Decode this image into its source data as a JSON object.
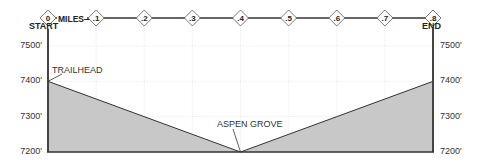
{
  "chart_data": {
    "type": "area",
    "title": "",
    "xlabel": "MILES",
    "ylabel": "",
    "x": [
      0,
      0.4,
      0.8
    ],
    "values": [
      7400,
      7200,
      7400
    ],
    "xlim": [
      0,
      0.8
    ],
    "ylim": [
      7200,
      7500
    ],
    "x_ticks": [
      "0",
      ".1",
      ".2",
      ".3",
      ".4",
      ".5",
      ".6",
      ".7",
      ".8"
    ],
    "y_ticks": [
      "7200'",
      "7300'",
      "7400'",
      "7500'"
    ],
    "grid": true,
    "annotations": [
      {
        "label": "START",
        "x": 0
      },
      {
        "label": "END",
        "x": 0.8
      },
      {
        "label": "TRAILHEAD",
        "x": 0,
        "y": 7400
      },
      {
        "label": "ASPEN GROVE",
        "x": 0.4,
        "y": 7200
      }
    ],
    "colors": {
      "fill": "#c8c8c8",
      "line": "#333333",
      "grid": "#e4e4e4"
    }
  },
  "labels": {
    "miles": "MILES",
    "start": "START",
    "end": "END",
    "trailhead": "TRAILHEAD",
    "aspen_grove": "ASPEN GROVE"
  }
}
